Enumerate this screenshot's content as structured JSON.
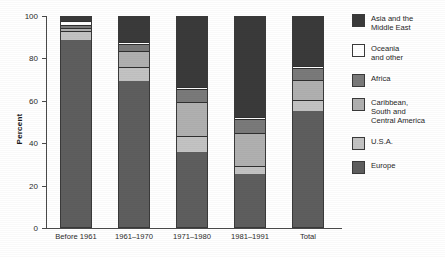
{
  "chart_data": {
    "type": "bar",
    "subtype": "stacked-percent",
    "title": "",
    "xlabel": "",
    "ylabel": "Percent",
    "ylim": [
      0,
      100
    ],
    "yticks": [
      0,
      20,
      40,
      60,
      80,
      100
    ],
    "grid": false,
    "legend_position": "right",
    "categories": [
      "Before 1961",
      "1961–1970",
      "1971–1980",
      "1981–1991",
      "Total"
    ],
    "series": [
      {
        "name": "Europe",
        "color": "#5e5e5e",
        "values": [
          88,
          69,
          35.5,
          25,
          54.5
        ]
      },
      {
        "name": "U.S.A.",
        "color": "#c3c3c3",
        "values": [
          4.5,
          6.5,
          7.5,
          4,
          5.5
        ]
      },
      {
        "name": "Caribbean, South and Central America",
        "color": "#b0b0b0",
        "values": [
          1.5,
          7.5,
          16,
          15.5,
          9.5
        ]
      },
      {
        "name": "Africa",
        "color": "#7a7a7a",
        "values": [
          1.5,
          3.5,
          6,
          6.5,
          5.5
        ]
      },
      {
        "name": "Oceania and other",
        "color": "#ffffff",
        "values": [
          1.5,
          1,
          1,
          1,
          1
        ]
      },
      {
        "name": "Asia and the Middle East",
        "color": "#3a3a3a",
        "values": [
          3,
          12.5,
          34,
          48,
          24
        ]
      }
    ]
  },
  "axis": {
    "y_title": "Percent",
    "tick_labels": [
      "100",
      "80",
      "60",
      "40",
      "20",
      "0"
    ]
  },
  "legend": {
    "items": [
      {
        "label": "Asia and the\nMiddle East",
        "color": "#3a3a3a"
      },
      {
        "label": "Oceania\nand other",
        "color": "#ffffff"
      },
      {
        "label": "Africa",
        "color": "#7a7a7a"
      },
      {
        "label": "Caribbean,\nSouth and\nCentral America",
        "color": "#b0b0b0"
      },
      {
        "label": "U.S.A.",
        "color": "#c3c3c3"
      },
      {
        "label": "Europe",
        "color": "#5e5e5e"
      }
    ]
  },
  "categories": {
    "c0": "Before 1961",
    "c1": "1961–1970",
    "c2": "1971–1980",
    "c3": "1981–1991",
    "c4": "Total"
  }
}
